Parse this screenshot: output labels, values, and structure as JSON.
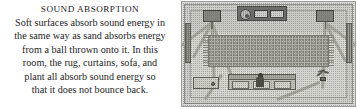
{
  "caption": {
    "title": "SOUND ABSORPTION",
    "lines": [
      "Soft surfaces absorb sound energy in",
      "the same way as sand absorbs energy",
      "from a ball thrown onto it. In this",
      "room, the rug, curtains, sofa, and",
      "plant all absorb sound energy so",
      "that it does not bounce back."
    ],
    "full_text": "Soft surfaces absorb sound energy in the same way as sand absorbs energy from a ball thrown onto it. In this room, the rug, curtains, sofa, and plant all absorb sound energy so that it does not bounce back."
  },
  "illustration": {
    "name": "room-sound-absorption-diagram",
    "objects": [
      "stereo-console",
      "turntable",
      "amplifier",
      "left-speaker",
      "right-speaker",
      "rug",
      "left-curtain",
      "right-curtain",
      "sofa",
      "seated-person",
      "potted-plant",
      "side-table",
      "sound-rays"
    ]
  },
  "colors": {
    "page_background": "#ffffff",
    "text": "#1d1d1d",
    "picture_field": "#d6d6d1",
    "picture_border": "#9a9a97",
    "object_dark": "#46463f",
    "ray": "#a6a69d"
  }
}
